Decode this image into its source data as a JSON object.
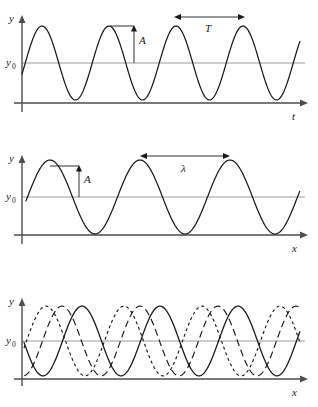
{
  "figure": {
    "background": "#ffffff",
    "curve_color": "#1a1a1a",
    "axis_color": "#4d4d4d",
    "reference_line_color": "#9a9a9a"
  },
  "panels": [
    {
      "id": "panel-time",
      "name": "displacement-versus-time",
      "y_axis_label": "y",
      "x_axis_label": "t",
      "reference_label": "y",
      "reference_sub": "0",
      "annotations": [
        {
          "name": "amplitude",
          "label": "A",
          "kind": "vertical-arrow"
        },
        {
          "name": "period",
          "label": "T",
          "kind": "horizontal-arrow"
        }
      ]
    },
    {
      "id": "panel-space",
      "name": "displacement-versus-distance",
      "y_axis_label": "y",
      "x_axis_label": "x",
      "reference_label": "y",
      "reference_sub": "0",
      "annotations": [
        {
          "name": "amplitude",
          "label": "A",
          "kind": "vertical-arrow"
        },
        {
          "name": "wavelength",
          "label": "λ",
          "kind": "horizontal-arrow"
        }
      ]
    },
    {
      "id": "panel-phase",
      "name": "phase-shifted-waves",
      "y_axis_label": "y",
      "x_axis_label": "x",
      "reference_label": "y",
      "reference_sub": "0",
      "annotations": []
    }
  ],
  "chart_data": {
    "type": "line",
    "charts": [
      {
        "id": "panel-time",
        "type": "line",
        "title": "",
        "xlabel": "t",
        "ylabel": "y",
        "grid": false,
        "legend": "none",
        "xlim": [
          0,
          290
        ],
        "ylim": [
          0,
          1
        ],
        "reference_lines": [
          {
            "label": "y0",
            "value": 0.5,
            "orientation": "horizontal",
            "color": "#9a9a9a"
          }
        ],
        "series": [
          {
            "name": "wave",
            "style": "solid",
            "form": "cosine",
            "amplitude": 0.37,
            "offset": 0.5,
            "period_px": 67,
            "phase_px": 42,
            "x_start_px": 22,
            "x_end_px": 300
          }
        ],
        "annotations": [
          {
            "label": "A",
            "type": "amplitude",
            "from_value": 0.5,
            "to_value": 0.87,
            "at_x_px": 110
          },
          {
            "label": "T",
            "type": "period",
            "from_x_px": 176,
            "to_x_px": 243,
            "at_value": 0.9
          }
        ]
      },
      {
        "id": "panel-space",
        "type": "line",
        "title": "",
        "xlabel": "x",
        "ylabel": "y",
        "grid": false,
        "legend": "none",
        "xlim": [
          0,
          290
        ],
        "ylim": [
          0,
          1
        ],
        "reference_lines": [
          {
            "label": "y0",
            "value": 0.5,
            "orientation": "horizontal",
            "color": "#9a9a9a"
          }
        ],
        "series": [
          {
            "name": "wave",
            "style": "solid",
            "form": "cosine",
            "amplitude": 0.37,
            "offset": 0.5,
            "period_px": 90,
            "phase_px": 50,
            "x_start_px": 26,
            "x_end_px": 300
          }
        ],
        "annotations": [
          {
            "label": "A",
            "type": "amplitude",
            "from_value": 0.5,
            "to_value": 0.87,
            "at_x_px": 80
          },
          {
            "label": "λ",
            "type": "wavelength",
            "from_x_px": 140,
            "to_x_px": 230,
            "at_value": 0.92
          }
        ]
      },
      {
        "id": "panel-phase",
        "type": "line",
        "title": "",
        "xlabel": "x",
        "ylabel": "y",
        "grid": false,
        "legend": "none",
        "xlim": [
          0,
          290
        ],
        "ylim": [
          0,
          1
        ],
        "reference_lines": [
          {
            "label": "y0",
            "value": 0.5,
            "orientation": "horizontal",
            "color": "#9a9a9a"
          }
        ],
        "series": [
          {
            "name": "wave-solid",
            "style": "solid",
            "form": "cosine",
            "amplitude": 0.42,
            "offset": 0.5,
            "period_px": 78,
            "phase_px": 82,
            "x_start_px": 24,
            "x_end_px": 300
          },
          {
            "name": "wave-dashed",
            "style": "dashed",
            "form": "cosine",
            "amplitude": 0.42,
            "offset": 0.5,
            "period_px": 78,
            "phase_px": 62,
            "x_start_px": 24,
            "x_end_px": 300
          },
          {
            "name": "wave-dotted",
            "style": "dotted",
            "form": "cosine",
            "amplitude": 0.42,
            "offset": 0.5,
            "period_px": 78,
            "phase_px": 46,
            "x_start_px": 24,
            "x_end_px": 300
          }
        ],
        "annotations": []
      }
    ]
  }
}
